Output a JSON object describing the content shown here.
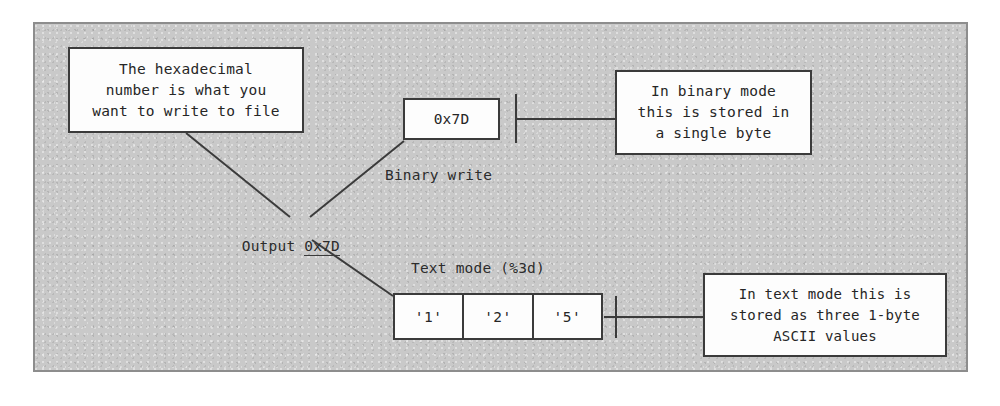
{
  "diagram": {
    "title_hidden": "",
    "frame": {
      "background_color": "#c9c9c9",
      "border_color": "#8d8d8d"
    },
    "boxes": {
      "hex_note": "The hexadecimal\nnumber is what you\nwant to write to file",
      "value": "0x7D",
      "binary_note": "In binary mode\nthis is stored in\na single byte",
      "text_note": "In text mode this is\nstored as three 1-byte\nASCII values"
    },
    "labels": {
      "output_prefix": "Output ",
      "output_value": "0x7D",
      "binary_write": "Binary write",
      "text_mode": "Text mode (%3d)"
    },
    "byte_cells": [
      "'1'",
      "'2'",
      "'5'"
    ],
    "colors": {
      "ink": "#3b3b3b",
      "text": "#262626",
      "box_fill": "#fdfdfd"
    }
  }
}
